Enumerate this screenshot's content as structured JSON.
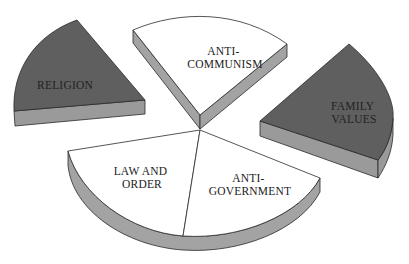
{
  "colors": {
    "dark_top": "#5f5f5f",
    "dark_side": "#9a9a9a",
    "light_top": "#ffffff",
    "light_side": "#a3a3a3",
    "outline": "#2a2a2a",
    "text": "#222222"
  },
  "segments": [
    {
      "id": "religion",
      "lines": [
        "RELIGION"
      ],
      "shade": "dark",
      "exploded": true
    },
    {
      "id": "anti-communism",
      "lines": [
        "ANTI-",
        "COMMUNISM"
      ],
      "shade": "light",
      "exploded": true
    },
    {
      "id": "family-values",
      "lines": [
        "FAMILY",
        "VALUES"
      ],
      "shade": "dark",
      "exploded": true
    },
    {
      "id": "law-and-order",
      "lines": [
        "LAW AND",
        "ORDER"
      ],
      "shade": "light",
      "exploded": false
    },
    {
      "id": "anti-government",
      "lines": [
        "ANTI-",
        "GOVERNMENT"
      ],
      "shade": "light",
      "exploded": false
    }
  ]
}
